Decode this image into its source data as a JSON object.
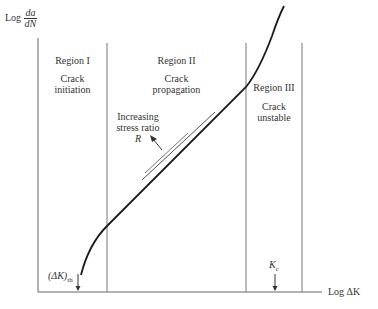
{
  "axes": {
    "y_label_prefix": "Log",
    "y_label_num": "da",
    "y_label_den": "dN",
    "x_label": "Log ΔK"
  },
  "regions": [
    {
      "title": "Region I",
      "line1": "Crack",
      "line2": "initiation"
    },
    {
      "title": "Region II",
      "line1": "Crack",
      "line2": "propagation"
    },
    {
      "title": "Region III",
      "line1": "Crack",
      "line2": "unstable"
    }
  ],
  "annotation": {
    "line1": "Increasing",
    "line2": "stress ratio",
    "line3": "R"
  },
  "markers": {
    "threshold_main": "(ΔK)",
    "threshold_sub": "th",
    "critical_main": "K",
    "critical_sub": "c"
  },
  "colors": {
    "axis": "#555555",
    "curve": "#1a1a1a",
    "text": "#333333"
  }
}
